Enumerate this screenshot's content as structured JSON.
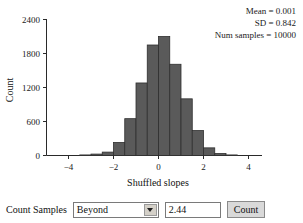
{
  "chart_data": {
    "type": "bar",
    "title": "",
    "xlabel": "Shuffled slopes",
    "ylabel": "Count",
    "xlim": [
      -5,
      5
    ],
    "ylim": [
      0,
      2400
    ],
    "grid": false,
    "legend": "none",
    "bin_width": 0.5,
    "categories": [
      "-3.5",
      "-3.0",
      "-2.5",
      "-2.0",
      "-1.5",
      "-1.0",
      "-0.5",
      "0.0",
      "0.5",
      "1.0",
      "1.5",
      "2.0",
      "2.5",
      "3.0"
    ],
    "bin_starts": [
      -3.5,
      -3.0,
      -2.5,
      -2.0,
      -1.5,
      -1.0,
      -0.5,
      0.0,
      0.5,
      1.0,
      1.5,
      2.0,
      2.5,
      3.0
    ],
    "values": [
      10,
      25,
      60,
      230,
      650,
      1280,
      1950,
      2100,
      1610,
      1000,
      440,
      135,
      35,
      10
    ],
    "xticks": [
      -4,
      -2,
      0,
      2,
      4
    ],
    "xtick_labels": [
      "−4",
      "−2",
      "0",
      "2",
      "4"
    ],
    "yticks": [
      0,
      600,
      1200,
      1800,
      2400
    ],
    "ytick_labels": [
      "0",
      "600",
      "1200",
      "1800",
      "2400"
    ],
    "bar_color": "#5a5a5a",
    "bar_edge_color": "#2f2f2f",
    "annotations": [
      "Mean = 0.001",
      "SD = 0.842",
      "Num samples = 10000"
    ]
  },
  "stats": {
    "mean_line": "Mean = 0.001",
    "sd_line": "SD = 0.842",
    "samples_line": "Num samples = 10000"
  },
  "controls": {
    "count_samples_label": "Count Samples",
    "condition_select": {
      "value": "Beyond",
      "options": [
        "Beyond"
      ]
    },
    "threshold_input": {
      "value": "2.44",
      "placeholder": ""
    },
    "count_button_label": "Count"
  }
}
